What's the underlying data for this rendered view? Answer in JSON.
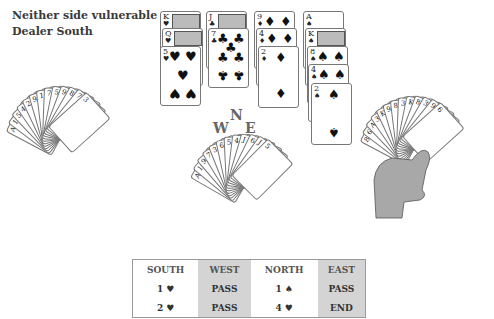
{
  "info": {
    "vulnerability": "Neither side vulnerable",
    "dealer": "Dealer South"
  },
  "compass": {
    "north": "N",
    "west": "W",
    "east": "E",
    "south": "S"
  },
  "dummy": {
    "hearts": [
      "K",
      "Q",
      "5"
    ],
    "clubs": [
      "J",
      "7"
    ],
    "diamonds": [
      "9",
      "4",
      "2"
    ],
    "spades": [
      "A",
      "K",
      "8",
      "4",
      "2"
    ]
  },
  "suits": {
    "hearts": "♥",
    "clubs": "♣",
    "diamonds": "♦",
    "spades": "♠"
  },
  "west_hand": {
    "visible_indices": [
      "A",
      "10",
      "5",
      "4",
      "2",
      "9",
      "10",
      "7",
      "5",
      "9",
      "8",
      "7",
      "3"
    ],
    "front_card": "3 of spades"
  },
  "east_hand": {
    "visible_indices": [
      "8",
      "6",
      "A",
      "3",
      "K",
      "9",
      "8",
      "3",
      "K",
      "8",
      "3",
      "9",
      "6"
    ],
    "front_card": "6 of spades"
  },
  "south_hand": {
    "visible_indices": [
      "A",
      "10",
      "9",
      "7",
      "3",
      "6",
      "5",
      "4",
      "J",
      "6",
      "J",
      "5"
    ],
    "front_card": "5 of spades"
  },
  "bidding": {
    "headers": [
      "SOUTH",
      "WEST",
      "NORTH",
      "EAST"
    ],
    "rows": [
      [
        "1 ♥",
        "PASS",
        "1 ♠",
        "PASS"
      ],
      [
        "2 ♥",
        "PASS",
        "4 ♥",
        "END"
      ]
    ]
  },
  "colors": {
    "shade": "#d4d4d4",
    "border": "#999999",
    "hand": "#a8a8a8"
  }
}
